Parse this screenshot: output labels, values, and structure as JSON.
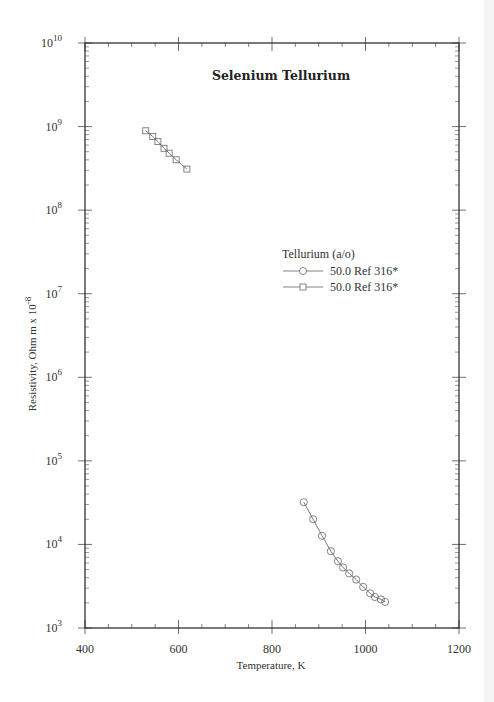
{
  "chart_data": {
    "type": "line",
    "title": "Selenium  Tellurium",
    "xlabel": "Temperature,  K",
    "ylabel": "Resistivity, Ohm  m x 10",
    "ylabel_exponent": "-8",
    "xlim": [
      400,
      1200
    ],
    "ylim": [
      1000,
      10000000000
    ],
    "yscale": "log",
    "grid": false,
    "x_ticks": [
      400,
      600,
      800,
      1000,
      1200
    ],
    "x_tick_labels": [
      "400",
      "600",
      "800",
      "1000",
      "1200"
    ],
    "y_ticks": [
      1000,
      10000,
      100000,
      1000000,
      10000000,
      100000000,
      1000000000,
      10000000000
    ],
    "y_tick_labels": [
      {
        "base": "10",
        "exp": "3"
      },
      {
        "base": "10",
        "exp": "4"
      },
      {
        "base": "10",
        "exp": "5"
      },
      {
        "base": "10",
        "exp": "6"
      },
      {
        "base": "10",
        "exp": "7"
      },
      {
        "base": "10",
        "exp": "8"
      },
      {
        "base": "10",
        "exp": "9"
      },
      {
        "base": "10",
        "exp": "10"
      }
    ],
    "legend": {
      "title": "Tellurium (a/o)",
      "placement": "center-right"
    },
    "series": [
      {
        "name": "50.0 Ref 316*",
        "marker": "circle",
        "x": [
          868,
          888,
          907,
          926,
          941,
          952,
          965,
          980,
          995,
          1010,
          1020,
          1033,
          1042
        ],
        "y": [
          32000,
          20000,
          12700,
          8300,
          6300,
          5300,
          4500,
          3800,
          3100,
          2600,
          2350,
          2200,
          2050
        ]
      },
      {
        "name": "50.0 Ref 316*",
        "marker": "square",
        "x": [
          530,
          545,
          556,
          569,
          580,
          595,
          618
        ],
        "y": [
          890000000,
          760000000,
          660000000,
          550000000,
          480000000,
          400000000,
          310000000
        ]
      }
    ]
  },
  "colors": {
    "axis": "#333333",
    "series_line": "#555555",
    "marker": "#666666"
  }
}
